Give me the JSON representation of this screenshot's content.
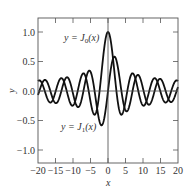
{
  "chart_data": {
    "type": "line",
    "title": "",
    "xlabel": "x",
    "ylabel": "y",
    "xlim": [
      -20,
      20
    ],
    "ylim": [
      -1.25,
      1.25
    ],
    "xticks": [
      -20,
      -15,
      -10,
      -5,
      0,
      5,
      10,
      15,
      20
    ],
    "xtick_labels": [
      "−20",
      "−15",
      "−10",
      "−5",
      "0",
      "5",
      "10",
      "15",
      "20"
    ],
    "yticks": [
      1.0,
      0.5,
      0.0,
      -0.5,
      -1.0
    ],
    "ytick_labels": [
      "1.0",
      "0.5",
      "0.0",
      "−0.5",
      "−1.0"
    ],
    "grid": false,
    "series": [
      {
        "name": "y = J0(x)",
        "function": "besselJ0",
        "color": "#111111",
        "sample_x": [
          -20,
          -15,
          -10,
          -5,
          0,
          5,
          10,
          15,
          20
        ],
        "sample_y": [
          0.167,
          -0.014,
          -0.246,
          -0.178,
          1.0,
          -0.178,
          -0.246,
          -0.014,
          0.167
        ]
      },
      {
        "name": "y = J1(x)",
        "function": "besselJ1",
        "color": "#111111",
        "sample_x": [
          -20,
          -15,
          -10,
          -5,
          0,
          5,
          10,
          15,
          20
        ],
        "sample_y": [
          -0.067,
          -0.205,
          -0.043,
          0.328,
          0.0,
          -0.328,
          0.043,
          0.205,
          0.067
        ]
      }
    ],
    "annotations": [
      {
        "text_prefix": "y = J",
        "sub": "0",
        "suffix": "(x)",
        "x": -7,
        "y": 0.95
      },
      {
        "text_prefix": "y = J",
        "sub": "1",
        "suffix": "(x)",
        "x": -7,
        "y": -0.8
      }
    ]
  },
  "labels": {
    "xlabel": "x",
    "ylabel": "y",
    "j0_prefix": "y = J",
    "j0_sub": "0",
    "j0_suffix": "(x)",
    "j1_prefix": "y = J",
    "j1_sub": "1",
    "j1_suffix": "(x)"
  }
}
